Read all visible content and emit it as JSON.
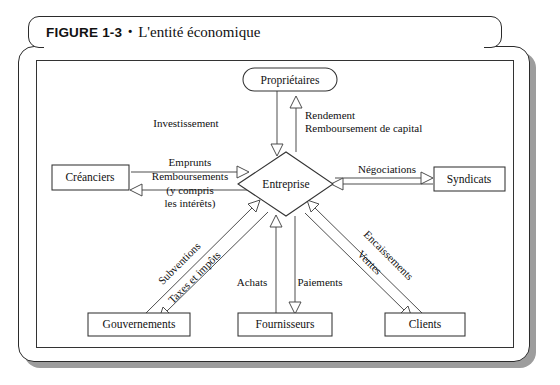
{
  "figure": {
    "number": "FIGURE 1-3",
    "bullet": "•",
    "caption": "L'entité économique"
  },
  "diagram": {
    "type": "entity-relationship-flow",
    "center_node": {
      "id": "entreprise",
      "label": "Entreprise",
      "shape": "diamond"
    },
    "nodes": [
      {
        "id": "proprietaires",
        "label": "Propriétaires",
        "shape": "stadium",
        "position": "top"
      },
      {
        "id": "creanciers",
        "label": "Créanciers",
        "shape": "rectangle",
        "position": "left"
      },
      {
        "id": "syndicats",
        "label": "Syndicats",
        "shape": "rectangle",
        "position": "right"
      },
      {
        "id": "gouvernements",
        "label": "Gouvernements",
        "shape": "rectangle",
        "position": "bottom-left"
      },
      {
        "id": "fournisseurs",
        "label": "Fournisseurs",
        "shape": "rectangle",
        "position": "bottom-center"
      },
      {
        "id": "clients",
        "label": "Clients",
        "shape": "rectangle",
        "position": "bottom-right"
      }
    ],
    "edge_labels": {
      "investissement": "Investissement",
      "rendement": "Rendement",
      "remboursement_capital": "Remboursement de capital",
      "emprunts": "Emprunts",
      "remboursements": "Remboursements",
      "y_compris": "(y compris",
      "les_interets": "les intérêts)",
      "negociations": "Négociations",
      "subventions": "Subventions",
      "taxes_impots": "Taxes et impôts",
      "achats": "Achats",
      "paiements": "Paiements",
      "encaissements": "Encaissements",
      "ventes": "Ventes"
    },
    "edges": [
      {
        "from": "proprietaires",
        "to": "entreprise",
        "label": "Investissement"
      },
      {
        "from": "entreprise",
        "to": "proprietaires",
        "label": "Rendement / Remboursement de capital"
      },
      {
        "from": "creanciers",
        "to": "entreprise",
        "label": "Emprunts"
      },
      {
        "from": "entreprise",
        "to": "creanciers",
        "label": "Remboursements (y compris les intérêts)"
      },
      {
        "from": "entreprise",
        "to": "syndicats",
        "label": "Négociations"
      },
      {
        "from": "gouvernements",
        "to": "entreprise",
        "label": "Subventions"
      },
      {
        "from": "entreprise",
        "to": "gouvernements",
        "label": "Taxes et impôts"
      },
      {
        "from": "fournisseurs",
        "to": "entreprise",
        "label": "Achats"
      },
      {
        "from": "entreprise",
        "to": "fournisseurs",
        "label": "Paiements"
      },
      {
        "from": "clients",
        "to": "entreprise",
        "label": "Encaissements"
      },
      {
        "from": "entreprise",
        "to": "clients",
        "label": "Ventes"
      }
    ]
  },
  "colors": {
    "frame_border": "#2b2b2b",
    "frame_shadow": "#9d9d9d",
    "line": "#444444",
    "text": "#111111",
    "background": "#ffffff"
  }
}
